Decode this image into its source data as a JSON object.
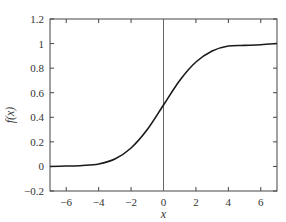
{
  "chart_data": {
    "type": "line",
    "title": "",
    "xlabel": "x",
    "ylabel": "f(x)",
    "xlim": [
      -7,
      7
    ],
    "ylim": [
      -0.2,
      1.2
    ],
    "grid": false,
    "legend": null,
    "x_ticks": [
      "-6",
      "-4",
      "-2",
      "0",
      "2",
      "4",
      "6"
    ],
    "y_ticks": [
      "-0.2",
      "0",
      "0.2",
      "0.4",
      "0.6",
      "0.8",
      "1",
      "1.2"
    ],
    "annotations": [
      {
        "type": "vertical-line",
        "x": 0
      }
    ],
    "series": [
      {
        "name": "f(x)",
        "x": [
          -7,
          -6,
          -5,
          -4,
          -3,
          -2,
          -1,
          0,
          1,
          2,
          3,
          4,
          5,
          6,
          7
        ],
        "values": [
          0.0,
          0.003,
          0.008,
          0.02,
          0.06,
          0.15,
          0.3,
          0.5,
          0.7,
          0.85,
          0.94,
          0.98,
          0.985,
          0.99,
          1.0
        ]
      }
    ]
  },
  "colors": {
    "line": "#1a1a1a",
    "axis": "#444444",
    "zero_line": "#666666"
  }
}
